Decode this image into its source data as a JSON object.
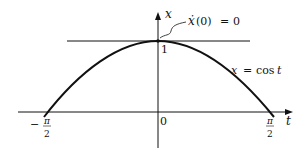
{
  "diagram": {
    "axes": {
      "x_label": "t",
      "y_label": "x",
      "origin_label": "0",
      "y_tick_label": "1",
      "x_tick_left": {
        "sign": "−",
        "numerator": "π",
        "denominator": "2"
      },
      "x_tick_right": {
        "numerator": "π",
        "denominator": "2"
      }
    },
    "curve_label": {
      "lhs": "x",
      "eq": "=",
      "rhs": "cos",
      "var": "t"
    },
    "annotation": {
      "text_func": "ẋ",
      "text_arg": "(0)",
      "eq": "=",
      "value": "0"
    }
  }
}
